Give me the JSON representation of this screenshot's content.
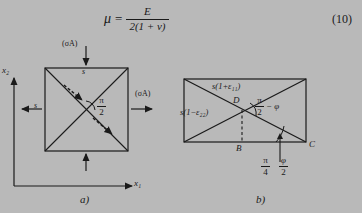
{
  "equation": {
    "lhs": "μ",
    "eq_sign": "=",
    "numerator": "E",
    "denominator": "2(1 + ν)",
    "number": "(10)"
  },
  "figure_a": {
    "caption": "a)",
    "axis_x_label": "x₁",
    "axis_y_label": "x₂",
    "force_top": "(σA)",
    "force_right": "(σA)",
    "side_top": "s",
    "side_left": "s",
    "angle_numerator": "π",
    "angle_denominator": "2"
  },
  "figure_b": {
    "caption": "b)",
    "top_label": "s(1+ε₁₁)",
    "left_label": "s(1−ε₂₂)",
    "point_d": "D",
    "point_b": "B",
    "point_c": "C",
    "angle_d_numerator": "π",
    "angle_d_denominator": "2",
    "angle_d_rest": "− φ",
    "angle_c_left_numerator": "π",
    "angle_c_left_denominator": "4",
    "angle_c_right_numerator": "φ",
    "angle_c_right_denominator": "2"
  },
  "colors": {
    "background": "#b9b9b9",
    "ink": "#1a1a1a"
  }
}
